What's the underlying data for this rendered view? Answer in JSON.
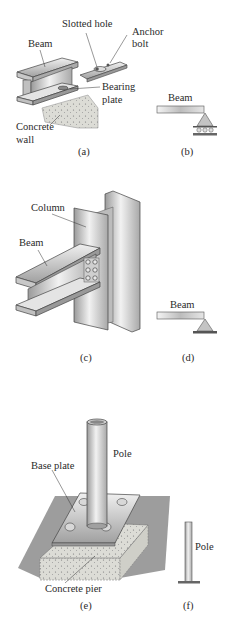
{
  "panels": {
    "a": {
      "caption": "(a)",
      "labels": {
        "slotted_hole": "Slotted hole",
        "anchor_bolt_1": "Anchor",
        "anchor_bolt_2": "bolt",
        "beam": "Beam",
        "bearing_plate_1": "Bearing",
        "bearing_plate_2": "plate",
        "concrete_wall_1": "Concrete",
        "concrete_wall_2": "wall"
      }
    },
    "b": {
      "caption": "(b)",
      "labels": {
        "beam": "Beam"
      },
      "support": "roller"
    },
    "c": {
      "caption": "(c)",
      "labels": {
        "column": "Column",
        "beam": "Beam"
      }
    },
    "d": {
      "caption": "(d)",
      "labels": {
        "beam": "Beam"
      },
      "support": "pin"
    },
    "e": {
      "caption": "(e)",
      "labels": {
        "pole": "Pole",
        "base_plate": "Base plate",
        "concrete_pier": "Concrete pier"
      }
    },
    "f": {
      "caption": "(f)",
      "labels": {
        "pole": "Pole"
      },
      "support": "fixed"
    }
  },
  "colors": {
    "steel_light": "#e8e8e8",
    "steel_mid": "#bdbdbd",
    "steel_dark": "#8a8a8a",
    "concrete": "#d9d9d4",
    "ground": "#7d7d7d",
    "outline": "#444444"
  }
}
